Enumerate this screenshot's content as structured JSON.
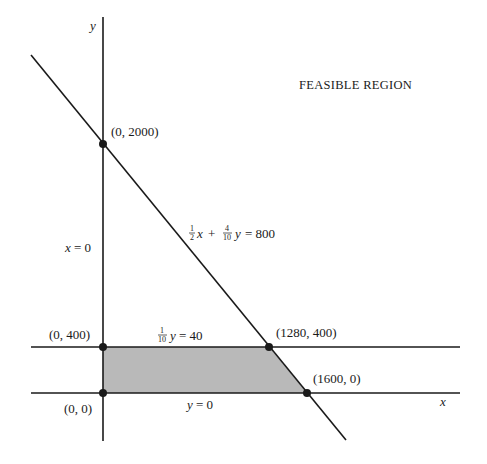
{
  "title": "FEASIBLE REGION",
  "axes": {
    "x_label": "x",
    "y_label": "y"
  },
  "constraints": {
    "c1": {
      "label_lhs_a_num": "1",
      "label_lhs_a_den": "2",
      "label_var_a": "x",
      "label_plus": "+",
      "label_lhs_b_num": "4",
      "label_lhs_b_den": "10",
      "label_var_b": "y",
      "label_rhs": "= 800"
    },
    "c2": {
      "label_num": "1",
      "label_den": "10",
      "label_var": "y",
      "label_rhs": "= 40"
    },
    "c3": {
      "label_var": "y",
      "label_rhs": "= 0"
    },
    "c4": {
      "label_var": "x",
      "label_rhs": "= 0"
    }
  },
  "points": [
    {
      "label": "(0, 2000)"
    },
    {
      "label": "(0, 400)"
    },
    {
      "label": "(0, 0)"
    },
    {
      "label": "(1280, 400)"
    },
    {
      "label": "(1600, 0)"
    }
  ],
  "colors": {
    "line": "#1a1a1a",
    "fill": "#b9b9b9"
  }
}
